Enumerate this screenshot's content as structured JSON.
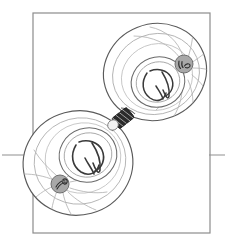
{
  "figure": {
    "background_color": "#ffffff",
    "ink_color": "#3a3a3a",
    "light_ink_color": "#9a9a9a",
    "badge_fill": "#a8a8a8",
    "badge_stroke": "#6e6e6e",
    "midbody_fill": "#2b2b2b",
    "frame": {
      "label": "panel-border",
      "x": 33,
      "y": 13,
      "width": 177,
      "height": 220,
      "stroke": "#8c8c8c",
      "stroke_width": 1.2
    },
    "guide_lines": [
      {
        "label": "left-guide-line",
        "x1": 2,
        "y1": 155,
        "x2": 33,
        "y2": 155,
        "stroke": "#9a9a9a"
      },
      {
        "label": "right-guide-line",
        "x1": 210,
        "y1": 155,
        "x2": 225,
        "y2": 155,
        "stroke": "#9a9a9a"
      }
    ],
    "cells": [
      {
        "name": "upper-right-daughter-cell",
        "cx": 155,
        "cy": 72,
        "rx": 52,
        "ry": 48,
        "rotation": -22,
        "membrane_stroke": "#5a5a5a",
        "cortex_rings": 2,
        "nucleus": {
          "name": "upper-nucleus",
          "cx": 158,
          "cy": 82,
          "rx": 27,
          "ry": 25,
          "rotation": -20,
          "stroke": "#6a6a6a",
          "chromatin_stroke": "#3a3a3a"
        },
        "centrosome": {
          "name": "upper-centrosome-badge",
          "cx": 184,
          "cy": 64,
          "r": 9
        },
        "aster_fiber_count": 9
      },
      {
        "name": "lower-left-daughter-cell",
        "cx": 78,
        "cy": 163,
        "rx": 55,
        "ry": 52,
        "rotation": -15,
        "membrane_stroke": "#5a5a5a",
        "cortex_rings": 2,
        "nucleus": {
          "name": "lower-nucleus",
          "cx": 88,
          "cy": 155,
          "rx": 29,
          "ry": 27,
          "rotation": -18,
          "stroke": "#6a6a6a",
          "chromatin_stroke": "#3a3a3a"
        },
        "centrosome": {
          "name": "lower-centrosome-badge",
          "cx": 60,
          "cy": 184,
          "r": 9
        },
        "aster_fiber_count": 9
      }
    ],
    "midbody": {
      "name": "midbody-bridge",
      "cx": 123,
      "cy": 118,
      "width": 19,
      "height": 13,
      "rotation": -38,
      "stripe_count": 6
    }
  }
}
